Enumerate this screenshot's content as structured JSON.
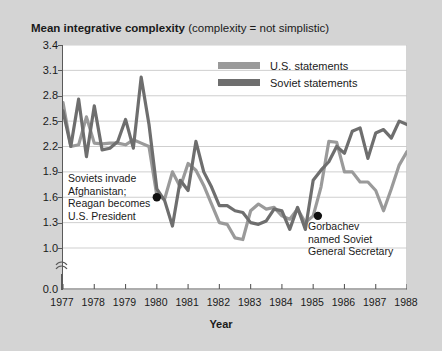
{
  "title": {
    "strong": "Mean integrative complexity",
    "light": " (complexity = not simplistic)"
  },
  "axis": {
    "x_title": "Year",
    "y_ticks": [
      "3.4",
      "3.1",
      "2.8",
      "2.5",
      "2.2",
      "1.9",
      "1.6",
      "1.3",
      "1.0",
      "0.0"
    ],
    "x_ticks": [
      "1977",
      "1978",
      "1979",
      "1980",
      "1981",
      "1982",
      "1983",
      "1984",
      "1985",
      "1986",
      "1987",
      "1988"
    ]
  },
  "legend": {
    "items": [
      {
        "label": "U.S. statements",
        "color": "#9a9a9a"
      },
      {
        "label": "Soviet statements",
        "color": "#6e6e6e"
      }
    ]
  },
  "annotations": [
    {
      "id": "soviets-invade",
      "lines": [
        "Soviets invade",
        "Afghanistan;",
        "Reagan becomes",
        "U.S. President"
      ],
      "marker_x": 1980.0,
      "marker_y": 1.6
    },
    {
      "id": "gorbachev",
      "lines": [
        "Gorbachev",
        "named Soviet",
        "General Secretary"
      ],
      "marker_x": 1985.15,
      "marker_y": 1.38
    }
  ],
  "chart_data": {
    "type": "line",
    "title": "Mean integrative complexity (complexity = not simplistic)",
    "xlabel": "Year",
    "ylabel": "Mean integrative complexity",
    "xlim": [
      1977,
      1988
    ],
    "ylim": [
      1.0,
      3.4
    ],
    "y_axis_break_below": 1.0,
    "grid": true,
    "grid_step": 0.3,
    "legend_position": "top-center",
    "series": [
      {
        "name": "U.S. statements",
        "color": "#9a9a9a",
        "x": [
          1977.0,
          1977.25,
          1977.5,
          1977.75,
          1978.0,
          1978.25,
          1978.5,
          1978.75,
          1979.0,
          1979.25,
          1979.5,
          1979.75,
          1980.0,
          1980.25,
          1980.5,
          1980.75,
          1981.0,
          1981.25,
          1981.5,
          1981.75,
          1982.0,
          1982.25,
          1982.5,
          1982.75,
          1983.0,
          1983.25,
          1983.5,
          1983.75,
          1984.0,
          1984.25,
          1984.5,
          1984.75,
          1985.0,
          1985.25,
          1985.5,
          1985.75,
          1986.0,
          1986.25,
          1986.5,
          1986.75,
          1987.0,
          1987.25,
          1987.5,
          1987.75,
          1988.0
        ],
        "y": [
          2.72,
          2.2,
          2.22,
          2.55,
          2.24,
          2.23,
          2.24,
          2.24,
          2.22,
          2.28,
          2.24,
          2.2,
          1.62,
          1.58,
          1.9,
          1.72,
          2.0,
          1.92,
          1.74,
          1.52,
          1.3,
          1.28,
          1.12,
          1.1,
          1.44,
          1.52,
          1.46,
          1.48,
          1.38,
          1.34,
          1.46,
          1.3,
          1.38,
          1.72,
          2.26,
          2.25,
          1.9,
          1.9,
          1.78,
          1.78,
          1.68,
          1.44,
          1.7,
          1.98,
          2.14
        ]
      },
      {
        "name": "Soviet statements",
        "color": "#6e6e6e",
        "x": [
          1977.0,
          1977.25,
          1977.5,
          1977.75,
          1978.0,
          1978.25,
          1978.5,
          1978.75,
          1979.0,
          1979.25,
          1979.5,
          1979.75,
          1980.0,
          1980.25,
          1980.5,
          1980.75,
          1981.0,
          1981.25,
          1981.5,
          1981.75,
          1982.0,
          1982.25,
          1982.5,
          1982.75,
          1983.0,
          1983.25,
          1983.5,
          1983.75,
          1984.0,
          1984.25,
          1984.5,
          1984.75,
          1985.0,
          1985.25,
          1985.5,
          1985.75,
          1986.0,
          1986.25,
          1986.5,
          1986.75,
          1987.0,
          1987.25,
          1987.5,
          1987.75,
          1988.0
        ],
        "y": [
          2.62,
          2.2,
          2.76,
          2.08,
          2.68,
          2.16,
          2.18,
          2.26,
          2.52,
          2.18,
          3.02,
          2.46,
          1.7,
          1.56,
          1.26,
          1.8,
          1.68,
          2.26,
          1.9,
          1.72,
          1.5,
          1.5,
          1.44,
          1.42,
          1.3,
          1.28,
          1.32,
          1.46,
          1.44,
          1.22,
          1.48,
          1.22,
          1.8,
          1.92,
          2.02,
          2.2,
          2.12,
          2.38,
          2.42,
          2.06,
          2.36,
          2.4,
          2.3,
          2.5,
          2.46
        ]
      }
    ]
  }
}
